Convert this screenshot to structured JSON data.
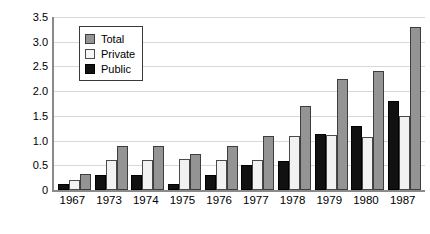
{
  "chart_data": {
    "type": "bar",
    "title": "",
    "xlabel": "",
    "ylabel": "$ million",
    "ylim": [
      0,
      3.5
    ],
    "yticks": [
      "0",
      "0.5",
      "1.0",
      "1.5",
      "2.0",
      "2.5",
      "3.0",
      "3.5"
    ],
    "ytick_values": [
      0,
      0.5,
      1.0,
      1.5,
      2.0,
      2.5,
      3.0,
      3.5
    ],
    "grid": true,
    "legend_position": "upper-left-inside",
    "categories": [
      "1967",
      "1973",
      "1974",
      "1975",
      "1976",
      "1977",
      "1978",
      "1979",
      "1980",
      "1987"
    ],
    "series": [
      {
        "name": "Public",
        "color": "#111111",
        "values": [
          0.12,
          0.3,
          0.3,
          0.12,
          0.3,
          0.5,
          0.58,
          1.13,
          1.3,
          1.8
        ]
      },
      {
        "name": "Private",
        "color": "#f2f2f2",
        "values": [
          0.2,
          0.6,
          0.6,
          0.62,
          0.6,
          0.6,
          1.1,
          1.12,
          1.08,
          1.5
        ]
      },
      {
        "name": "Total",
        "color": "#949494",
        "values": [
          0.33,
          0.9,
          0.9,
          0.72,
          0.9,
          1.1,
          1.7,
          2.25,
          2.4,
          3.3
        ]
      }
    ],
    "bar_order_in_group": [
      "Public",
      "Private",
      "Total"
    ]
  },
  "legend": {
    "entries": [
      {
        "label": "Total",
        "swatch": "total-swatch"
      },
      {
        "label": "Private",
        "swatch": "private-swatch"
      },
      {
        "label": "Public",
        "swatch": "public-swatch"
      }
    ]
  },
  "colors": {
    "total": "#949494",
    "private": "#f2f2f2",
    "public": "#111111",
    "axis": "#8a8a8a",
    "grid": "#d8d8d8",
    "background": "#ffffff"
  }
}
